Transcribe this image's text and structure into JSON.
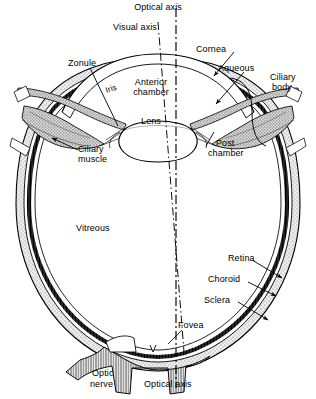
{
  "figure": {
    "background_color": "#ffffff",
    "line_color": "#000000",
    "sclera_fill": "#e8e8e8",
    "choroid_fill": "#3a3a3a",
    "ciliary_fill": "#d4d4d4"
  },
  "labels": {
    "optical_axis_top": "Optical axis",
    "visual_axis": "Visual axis",
    "cornea": "Cornea",
    "aqueous": "Aqueous",
    "ciliary_body_l1": "Ciliary",
    "ciliary_body_l2": "body",
    "zonule": "Zonule",
    "iris": "Iris",
    "anterior_chamber_l1": "Anterior",
    "anterior_chamber_l2": "chamber",
    "lens": "Lens",
    "post_chamber_l1": "Post",
    "post_chamber_l2": "chamber",
    "ciliary_muscle_l1": "Ciliary",
    "ciliary_muscle_l2": "muscle",
    "vitreous": "Vitreous",
    "retina": "Retina",
    "choroid": "Choroid",
    "sclera": "Sclera",
    "fovea": "Fovea",
    "optic_nerve_l1": "Optic",
    "optic_nerve_l2": "nerve",
    "optical_axis_bottom": "Optical axis"
  }
}
